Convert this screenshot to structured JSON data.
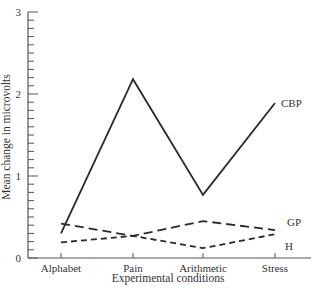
{
  "chart_data": {
    "type": "line",
    "title": "",
    "xlabel": "Experimental conditions",
    "ylabel": "Mean change in microvolts",
    "categories": [
      "Alphabet",
      "Pain",
      "Arithmetic",
      "Stress"
    ],
    "ylim": [
      0,
      3
    ],
    "yticks": [
      0,
      1,
      2,
      3
    ],
    "yminor_step": 0.1,
    "grid": false,
    "legend": "inline labels at line ends",
    "series": [
      {
        "name": "CBP",
        "style": "solid",
        "values": [
          0.3,
          2.18,
          0.77,
          1.89
        ]
      },
      {
        "name": "GP",
        "style": "long-dash",
        "values": [
          0.42,
          0.27,
          0.45,
          0.34
        ]
      },
      {
        "name": "H",
        "style": "short-dash",
        "values": [
          0.19,
          0.27,
          0.12,
          0.29
        ]
      }
    ]
  },
  "colors": {
    "line": "#2a2a2a",
    "axis": "#555555",
    "text": "#333333"
  }
}
